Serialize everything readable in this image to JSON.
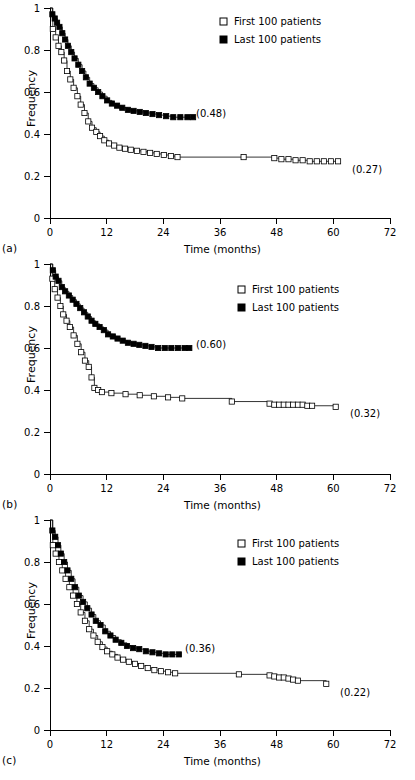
{
  "figure": {
    "panels": [
      {
        "tag": "(a)",
        "ylabel": "Frequency",
        "xlabel": "Time (months)",
        "legend": [
          {
            "marker": "open-square",
            "label": "First 100 patients"
          },
          {
            "marker": "filled-square",
            "label": "Last 100 patients"
          }
        ],
        "annotations": [
          {
            "text": "(0.48)",
            "series": "Last 100 patients"
          },
          {
            "text": "(0.27)",
            "series": "First 100 patients"
          }
        ]
      },
      {
        "tag": "(b)",
        "ylabel": "Frequency",
        "xlabel": "Time (months)",
        "legend": [
          {
            "marker": "open-square",
            "label": "First 100 patients"
          },
          {
            "marker": "filled-square",
            "label": "Last 100 patients"
          }
        ],
        "annotations": [
          {
            "text": "(0.60)",
            "series": "Last 100 patients"
          },
          {
            "text": "(0.32)",
            "series": "First 100 patients"
          }
        ]
      },
      {
        "tag": "(c)",
        "ylabel": "Frequency",
        "xlabel": "Time (months)",
        "legend": [
          {
            "marker": "open-square",
            "label": "First 100 patients"
          },
          {
            "marker": "filled-square",
            "label": "Last 100 patients"
          }
        ],
        "annotations": [
          {
            "text": "(0.36)",
            "series": "Last 100 patients"
          },
          {
            "text": "(0.22)",
            "series": "First 100 patients"
          }
        ]
      }
    ]
  },
  "chart_data": [
    {
      "type": "line",
      "panel": "(a)",
      "title": "",
      "xlabel": "Time (months)",
      "ylabel": "Frequency",
      "xlim": [
        0,
        72
      ],
      "ylim": [
        0,
        1
      ],
      "xticks": [
        0,
        12,
        24,
        36,
        48,
        60,
        72
      ],
      "xticklabels": [
        "0",
        "12",
        "24",
        "36",
        "48",
        "60",
        "72"
      ],
      "yticks": [
        0,
        0.2,
        0.4,
        0.6,
        0.8,
        1
      ],
      "yticklabels": [
        "0",
        "0.2",
        "0.4",
        "0.6",
        "0.8",
        "1"
      ],
      "grid": false,
      "legend_position": "top-right",
      "annotations": [
        {
          "text": "(0.48)",
          "x": 30.5,
          "y": 0.48
        },
        {
          "text": "(0.27)",
          "x": 63.5,
          "y": 0.27
        }
      ],
      "series": [
        {
          "name": "First 100 patients",
          "marker": "open-square",
          "x": [
            0,
            0.6,
            1.2,
            1.8,
            2.4,
            3.0,
            3.6,
            4.3,
            5.0,
            5.8,
            6.5,
            7.3,
            8.1,
            8.9,
            9.8,
            10.6,
            11.5,
            12.5,
            13.6,
            14.7,
            15.9,
            17.1,
            18.4,
            19.8,
            21.2,
            22.6,
            24.1,
            25.6,
            27.0,
            41.0,
            47.5,
            49.0,
            50.5,
            52.0,
            53.5,
            55.0,
            56.5,
            58.0,
            59.5,
            61.0
          ],
          "y": [
            1.0,
            0.9,
            0.86,
            0.82,
            0.79,
            0.75,
            0.7,
            0.66,
            0.62,
            0.58,
            0.54,
            0.5,
            0.46,
            0.43,
            0.41,
            0.39,
            0.37,
            0.355,
            0.345,
            0.335,
            0.33,
            0.325,
            0.32,
            0.315,
            0.31,
            0.305,
            0.3,
            0.295,
            0.29,
            0.29,
            0.285,
            0.28,
            0.28,
            0.275,
            0.275,
            0.27,
            0.27,
            0.27,
            0.27,
            0.27
          ]
        },
        {
          "name": "Last 100 patients",
          "marker": "filled-square",
          "x": [
            0,
            0.5,
            1.0,
            1.5,
            2.0,
            2.6,
            3.2,
            3.8,
            4.5,
            5.2,
            6.0,
            6.8,
            7.6,
            8.4,
            9.3,
            10.2,
            11.1,
            12.1,
            13.1,
            14.2,
            15.3,
            16.5,
            17.7,
            19.0,
            20.3,
            21.7,
            23.1,
            24.6,
            26.1,
            27.6,
            29.1,
            30.3
          ],
          "y": [
            1.0,
            0.97,
            0.95,
            0.93,
            0.91,
            0.88,
            0.85,
            0.82,
            0.79,
            0.76,
            0.73,
            0.7,
            0.67,
            0.64,
            0.62,
            0.6,
            0.58,
            0.56,
            0.545,
            0.535,
            0.525,
            0.515,
            0.51,
            0.505,
            0.5,
            0.495,
            0.49,
            0.485,
            0.48,
            0.48,
            0.48,
            0.48
          ]
        }
      ]
    },
    {
      "type": "line",
      "panel": "(b)",
      "title": "",
      "xlabel": "Time (months)",
      "ylabel": "Frequency",
      "xlim": [
        0,
        72
      ],
      "ylim": [
        0,
        1
      ],
      "xticks": [
        0,
        12,
        24,
        36,
        48,
        60,
        72
      ],
      "xticklabels": [
        "0",
        "12",
        "24",
        "36",
        "48",
        "60",
        "72"
      ],
      "yticks": [
        0,
        0.2,
        0.4,
        0.6,
        0.8,
        1
      ],
      "yticklabels": [
        "0",
        "0.2",
        "0.4",
        "0.6",
        "0.8",
        "1"
      ],
      "grid": false,
      "legend_position": "top-right",
      "annotations": [
        {
          "text": "(0.60)",
          "x": 30.0,
          "y": 0.6
        },
        {
          "text": "(0.32)",
          "x": 63.0,
          "y": 0.32
        }
      ],
      "series": [
        {
          "name": "First 100 patients",
          "marker": "open-square",
          "x": [
            0,
            0.5,
            1.0,
            1.6,
            2.2,
            2.8,
            3.5,
            4.2,
            5.0,
            5.8,
            6.6,
            7.4,
            8.2,
            8.8,
            9.4,
            10.2,
            11.0,
            13.0,
            16.0,
            19.0,
            22.0,
            25.0,
            28.0,
            38.5,
            46.5,
            47.5,
            48.5,
            49.5,
            50.5,
            51.5,
            52.5,
            53.5,
            54.5,
            55.5,
            60.5
          ],
          "y": [
            1.0,
            0.93,
            0.88,
            0.84,
            0.8,
            0.76,
            0.73,
            0.7,
            0.66,
            0.62,
            0.58,
            0.54,
            0.51,
            0.46,
            0.41,
            0.4,
            0.39,
            0.385,
            0.38,
            0.375,
            0.37,
            0.365,
            0.36,
            0.345,
            0.335,
            0.33,
            0.33,
            0.33,
            0.33,
            0.33,
            0.33,
            0.33,
            0.325,
            0.325,
            0.32
          ]
        },
        {
          "name": "Last 100 patients",
          "marker": "filled-square",
          "x": [
            0,
            0.6,
            1.2,
            1.8,
            2.5,
            3.2,
            4.0,
            4.8,
            5.6,
            6.4,
            7.2,
            8.0,
            8.8,
            9.6,
            10.5,
            11.4,
            12.3,
            13.3,
            14.3,
            15.4,
            16.5,
            17.7,
            18.9,
            20.2,
            21.5,
            22.9,
            24.3,
            25.7,
            27.1,
            28.5,
            29.5
          ],
          "y": [
            1.0,
            0.97,
            0.94,
            0.92,
            0.89,
            0.87,
            0.85,
            0.83,
            0.81,
            0.79,
            0.77,
            0.75,
            0.73,
            0.715,
            0.7,
            0.685,
            0.665,
            0.655,
            0.645,
            0.635,
            0.625,
            0.62,
            0.615,
            0.61,
            0.605,
            0.6,
            0.6,
            0.6,
            0.6,
            0.6,
            0.6
          ]
        }
      ]
    },
    {
      "type": "line",
      "panel": "(c)",
      "title": "",
      "xlabel": "Time (months)",
      "ylabel": "Frequency",
      "xlim": [
        0,
        72
      ],
      "ylim": [
        0,
        1
      ],
      "xticks": [
        0,
        12,
        24,
        36,
        48,
        60,
        72
      ],
      "xticklabels": [
        "0",
        "12",
        "24",
        "36",
        "48",
        "60",
        "72"
      ],
      "yticks": [
        0,
        0.2,
        0.4,
        0.6,
        0.8,
        1
      ],
      "yticklabels": [
        "0",
        "0.2",
        "0.4",
        "0.6",
        "0.8",
        "1"
      ],
      "grid": false,
      "legend_position": "top-right",
      "annotations": [
        {
          "text": "(0.36)",
          "x": 27.5,
          "y": 0.36
        },
        {
          "text": "(0.22)",
          "x": 60.0,
          "y": 0.22
        }
      ],
      "series": [
        {
          "name": "First 100 patients",
          "marker": "open-square",
          "x": [
            0,
            0.6,
            1.2,
            1.9,
            2.6,
            3.3,
            4.1,
            4.9,
            5.7,
            6.5,
            7.4,
            8.3,
            9.2,
            10.1,
            11.1,
            12.1,
            13.2,
            14.3,
            15.5,
            16.7,
            18.0,
            19.3,
            20.7,
            22.1,
            23.5,
            25.0,
            26.5,
            40.0,
            46.5,
            47.5,
            48.5,
            49.5,
            50.5,
            51.5,
            52.5,
            58.5
          ],
          "y": [
            1.0,
            0.88,
            0.84,
            0.8,
            0.76,
            0.72,
            0.68,
            0.64,
            0.6,
            0.56,
            0.52,
            0.48,
            0.45,
            0.42,
            0.395,
            0.375,
            0.36,
            0.345,
            0.335,
            0.325,
            0.315,
            0.305,
            0.295,
            0.285,
            0.28,
            0.275,
            0.27,
            0.265,
            0.26,
            0.255,
            0.25,
            0.25,
            0.245,
            0.24,
            0.235,
            0.22
          ]
        },
        {
          "name": "Last 100 patients",
          "marker": "filled-square",
          "x": [
            0,
            0.5,
            1.1,
            1.7,
            2.3,
            3.0,
            3.7,
            4.5,
            5.3,
            6.1,
            7.0,
            7.9,
            8.8,
            9.7,
            10.7,
            11.7,
            12.8,
            13.9,
            15.1,
            16.3,
            17.6,
            18.9,
            20.3,
            21.7,
            23.1,
            24.5,
            25.9,
            27.3
          ],
          "y": [
            1.0,
            0.95,
            0.92,
            0.88,
            0.84,
            0.8,
            0.76,
            0.72,
            0.68,
            0.64,
            0.61,
            0.58,
            0.55,
            0.52,
            0.5,
            0.47,
            0.45,
            0.43,
            0.415,
            0.4,
            0.39,
            0.385,
            0.375,
            0.37,
            0.365,
            0.36,
            0.36,
            0.36
          ]
        }
      ]
    }
  ]
}
